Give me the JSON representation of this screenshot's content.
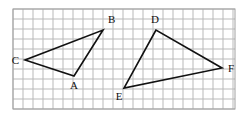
{
  "figure": {
    "type": "geometry-diagram",
    "width": 247,
    "height": 116,
    "background_color": "#ffffff"
  },
  "grid": {
    "name": "square-grid",
    "x": 13,
    "y": 9,
    "width": 222,
    "height": 100,
    "cell_size": 10,
    "columns": 22,
    "rows": 10,
    "line_color": "#b9b9b9",
    "border_color": "#a0a0a0",
    "visible": true
  },
  "shapes": {
    "stroke_color": "#111111",
    "stroke_width": 1.6,
    "fill": "none",
    "triangles": [
      {
        "name": "triangle-abc",
        "label": "ABC",
        "vertices": [
          {
            "label": "A",
            "x": 74,
            "y": 76,
            "label_x": 74,
            "label_y": 89,
            "label_anchor": "middle"
          },
          {
            "label": "B",
            "x": 103,
            "y": 30,
            "label_x": 108,
            "label_y": 23,
            "label_anchor": "start"
          },
          {
            "label": "C",
            "x": 25,
            "y": 60,
            "label_x": 19,
            "label_y": 64,
            "label_anchor": "end"
          }
        ],
        "edges": [
          {
            "name": "edge-ca",
            "from": "C",
            "to": "A"
          },
          {
            "name": "edge-ab",
            "from": "A",
            "to": "B"
          },
          {
            "name": "edge-bc",
            "from": "B",
            "to": "C"
          }
        ]
      },
      {
        "name": "triangle-def",
        "label": "DEF",
        "vertices": [
          {
            "label": "D",
            "x": 156,
            "y": 30,
            "label_x": 155,
            "label_y": 23,
            "label_anchor": "middle"
          },
          {
            "label": "E",
            "x": 124,
            "y": 88,
            "label_x": 119,
            "label_y": 100,
            "label_anchor": "middle"
          },
          {
            "label": "F",
            "x": 222,
            "y": 68,
            "label_x": 228,
            "label_y": 72,
            "label_anchor": "start"
          }
        ],
        "edges": [
          {
            "name": "edge-de",
            "from": "D",
            "to": "E"
          },
          {
            "name": "edge-ef",
            "from": "E",
            "to": "F"
          },
          {
            "name": "edge-fd",
            "from": "F",
            "to": "D"
          }
        ]
      }
    ]
  },
  "labels": {
    "a": "A",
    "b": "B",
    "c": "C",
    "d": "D",
    "e": "E",
    "f": "F"
  }
}
